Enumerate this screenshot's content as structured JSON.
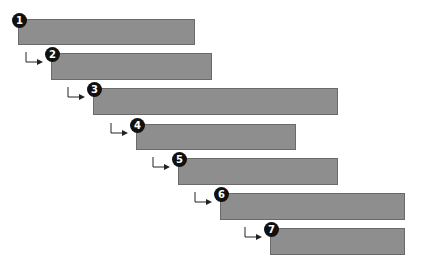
{
  "colors": {
    "bar_fill": "#8e8e8e",
    "bar_border": "#6a6a6a",
    "badge_bg": "#111111",
    "badge_text": "#ffffff",
    "arrow": "#222222"
  },
  "steps": [
    {
      "number": "1",
      "left": 18,
      "top": 19,
      "width": 177,
      "height": 26
    },
    {
      "number": "2",
      "left": 51,
      "top": 53,
      "width": 161,
      "height": 27
    },
    {
      "number": "3",
      "left": 93,
      "top": 88,
      "width": 245,
      "height": 27
    },
    {
      "number": "4",
      "left": 136,
      "top": 124,
      "width": 160,
      "height": 26
    },
    {
      "number": "5",
      "left": 178,
      "top": 158,
      "width": 160,
      "height": 27
    },
    {
      "number": "6",
      "left": 220,
      "top": 193,
      "width": 185,
      "height": 27
    },
    {
      "number": "7",
      "left": 270,
      "top": 228,
      "width": 135,
      "height": 27
    }
  ]
}
